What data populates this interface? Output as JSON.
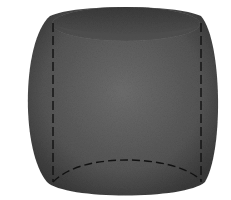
{
  "diagram": {
    "type": "3d-solid",
    "colors": {
      "background": "#ffffff",
      "body": "#555555",
      "body_dark": "#3a3a3a",
      "body_light": "#6e6e6e",
      "top_cavity": "#4a4a4a",
      "top_cavity_shadow": "#2e2e2e",
      "dashed_line": "#111111"
    },
    "elements": [
      {
        "name": "barrel-body",
        "kind": "solid"
      },
      {
        "name": "top-opening",
        "kind": "ellipse"
      },
      {
        "name": "left-hidden-edge",
        "kind": "dashed-line"
      },
      {
        "name": "right-hidden-edge",
        "kind": "dashed-line"
      },
      {
        "name": "bottom-hidden-arc",
        "kind": "dashed-arc"
      }
    ]
  }
}
